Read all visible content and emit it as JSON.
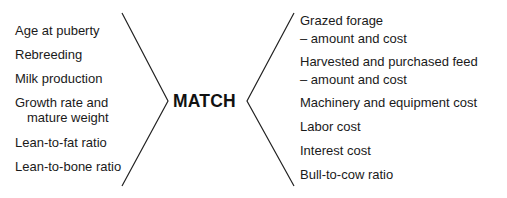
{
  "center_label": "MATCH",
  "left": {
    "items": [
      {
        "line1": "Age at puberty"
      },
      {
        "line1": "Rebreeding"
      },
      {
        "line1": "Milk production"
      },
      {
        "line1": "Growth rate and",
        "line2": "mature weight"
      },
      {
        "line1": "Lean-to-fat ratio"
      },
      {
        "line1": "Lean-to-bone ratio"
      }
    ]
  },
  "right": {
    "items": [
      {
        "line1": "Grazed forage",
        "line2": "– amount and cost"
      },
      {
        "line1": "Harvested and purchased feed",
        "line2": "– amount and cost"
      },
      {
        "line1": "Machinery and equipment cost"
      },
      {
        "line1": "Labor cost"
      },
      {
        "line1": "Interest cost"
      },
      {
        "line1": "Bull-to-cow ratio"
      }
    ]
  },
  "colors": {
    "line": "#222222",
    "text": "#1a1a1a",
    "background": "#ffffff"
  }
}
